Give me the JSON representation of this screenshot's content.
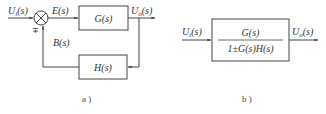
{
  "diagram_a": {
    "caption": "a )",
    "input_label": "Uᵢ(s)",
    "input_var": "U",
    "input_sub": "i",
    "input_arg": "(s)",
    "error_label": "E(s)",
    "forward_block": "G(s)",
    "output_var": "U",
    "output_sub": "o",
    "output_arg": "(s)",
    "feedback_label": "B(s)",
    "feedback_block": "H(s)",
    "sign": "∓"
  },
  "diagram_b": {
    "caption": "b )",
    "input_var": "U",
    "input_sub": "i",
    "input_arg": "(s)",
    "numerator": "G(s)",
    "denominator": "1±G(s)H(s)",
    "output_var": "U",
    "output_sub": "o",
    "output_arg": "(s)"
  },
  "colors": {
    "line": "#444444",
    "text": "#333333",
    "background": "#ffffff"
  }
}
